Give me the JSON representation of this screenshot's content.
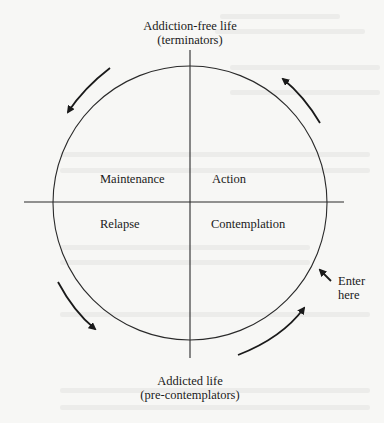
{
  "diagram": {
    "type": "cycle-of-change",
    "top_pole": {
      "line1": "Addiction-free life",
      "line2": "(terminators)"
    },
    "bottom_pole": {
      "line1": "Addicted life",
      "line2": "(pre-contemplators)"
    },
    "quadrants": {
      "top_left": "Maintenance",
      "top_right": "Action",
      "bottom_left": "Relapse",
      "bottom_right": "Contemplation"
    },
    "entry": {
      "line1": "Enter",
      "line2": "here"
    },
    "arrows": [
      {
        "position": "top-left",
        "direction": "counter-clockwise, toward Maintenance/Relapse side"
      },
      {
        "position": "top-right",
        "direction": "up toward Addiction-free life"
      },
      {
        "position": "bottom-left",
        "direction": "down toward Addicted life"
      },
      {
        "position": "bottom-right",
        "direction": "up toward Contemplation"
      },
      {
        "position": "entry",
        "direction": "into circle at Contemplation"
      }
    ],
    "colors": {
      "ink": "#1a1a1a",
      "paper": "#f7f7f5"
    }
  }
}
